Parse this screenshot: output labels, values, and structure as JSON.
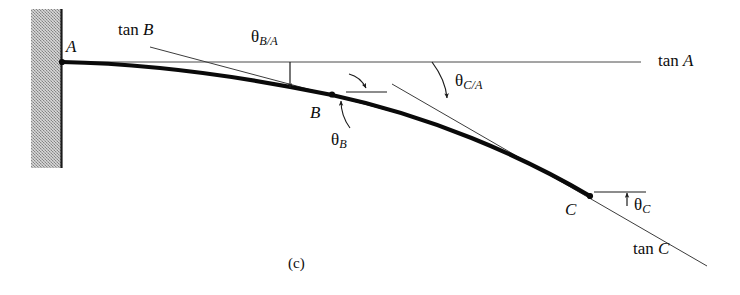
{
  "figure": {
    "caption": "(c)",
    "points": [
      {
        "id": "A",
        "label": "A",
        "x": 62,
        "y": 62
      },
      {
        "id": "B",
        "label": "B",
        "x": 332,
        "y": 94
      },
      {
        "id": "C",
        "label": "C",
        "x": 590,
        "y": 196
      }
    ],
    "tangent_lines": [
      {
        "id": "tan-a",
        "label_prefix": "tan",
        "label_point": "A",
        "x1": 62,
        "y1": 62,
        "x2": 641,
        "y2": 62
      },
      {
        "id": "tan-b",
        "label_prefix": "tan",
        "label_point": "B",
        "x1": 150,
        "y1": 47,
        "x2": 398,
        "y2": 113
      },
      {
        "id": "tan-c",
        "label_prefix": "tan",
        "label_point": "C",
        "x1": 392,
        "y1": 84,
        "x2": 707,
        "y2": 266
      }
    ],
    "angles": [
      {
        "id": "theta-b-over-a",
        "symbol": "θ",
        "subscript": "B/A"
      },
      {
        "id": "theta-c-over-a",
        "symbol": "θ",
        "subscript": "C/A"
      },
      {
        "id": "theta-b",
        "symbol": "θ",
        "subscript": "B"
      },
      {
        "id": "theta-c",
        "symbol": "θ",
        "subscript": "C"
      }
    ],
    "labels": {
      "point_a": "A",
      "point_b": "B",
      "point_c": "C",
      "tan_a": "tan A",
      "tan_b": "tan B",
      "tan_c": "tan C",
      "tan_word": "tan",
      "theta": "θ",
      "sub_b_over_a": "B/A",
      "sub_c_over_a": "C/A",
      "sub_b": "B",
      "sub_c": "C"
    },
    "colors": {
      "curve": "#0a0a0a",
      "thin_line": "#3c3c3c",
      "wall_fill": "#a8a8a8",
      "wall_edge": "#1a1a1a",
      "text": "#0d0d0d",
      "background": "#ffffff"
    },
    "geometry": {
      "beam_curve_path": "M 62 62 C 160 64, 250 78, 332 95 C 430 116, 520 155, 590 196",
      "wall": {
        "x": 31,
        "y": 9,
        "width": 30,
        "height": 159
      },
      "wall_edge_x": 61,
      "beam_start": {
        "x": 62,
        "y": 62
      },
      "beam_end": {
        "x": 590,
        "y": 196
      }
    }
  }
}
